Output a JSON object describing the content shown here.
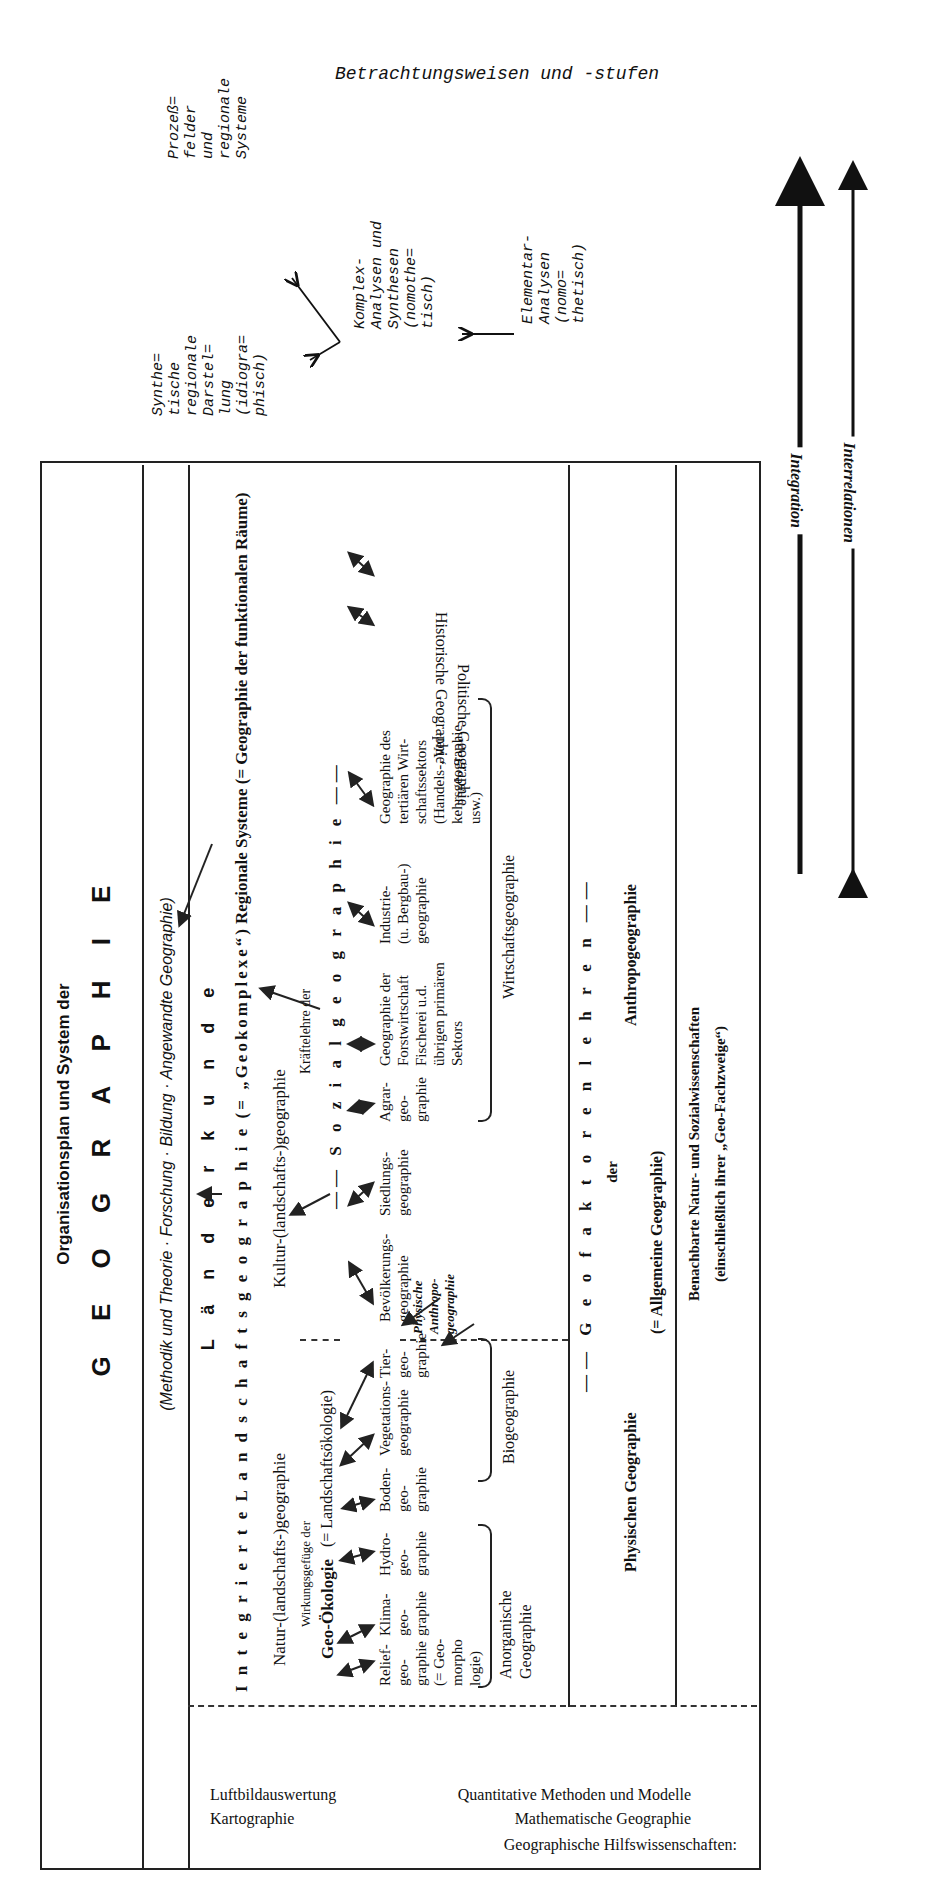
{
  "annotations": {
    "title": "Betrachtungsweisen und -stufen",
    "synthetische": "Synthe=\ntische\nregionale\nDarstel=\nlung\n(idiogra=\nphisch)",
    "prozess": "Prozeß=\nfelder\nund\nregionale\nSysteme",
    "komplex": "Komplex-\nAnalysen und\nSynthesen\n(nomothe=\ntisch)",
    "elementar": "Elementar-\nAnalysen\n(nomo=\nthetisch)",
    "interrelationen": "Interrelationen",
    "integration": "Integration"
  },
  "header": {
    "subtitle": "Organisationsplan und System der",
    "title": "G E O G R A P H I E"
  },
  "methodik_row": "(Methodik und Theorie · Forschung · Bildung · Angewandte Geographie)",
  "laenderkunde": {
    "title": "L ä n d e r k u n d e",
    "integrierte": "I n t e g r i e r t e  L a n d s c h a f t s g e o g r a p h i e (= „Geokomplexe“)",
    "regionale": "Regionale Systeme (= Geographie der funktionalen Räume)"
  },
  "natur": "Natur-(landschafts-)geographie",
  "kultur": "Kultur-(landschafts-)geographie",
  "wirkungsgefuege": "Wirkungsgefüge der",
  "geooekologie": "Geo-Ökologie",
  "landschaftsoekologie": "(= Landschaftsökologie)",
  "kraeftelehre": "Kräftelehre der",
  "sozialgeographie": "—— S o z i a l g e o g r a p h i e ——",
  "physical_items": [
    {
      "label": "Relief-\ngeo-\ngraphie\n(= Geo-\nmorpho\nlogie)"
    },
    {
      "label": "Klima-\ngeo-\ngraphie"
    },
    {
      "label": "Hydro-\ngeo-\ngraphie"
    },
    {
      "label": "Boden-\ngeo-\ngraphie"
    },
    {
      "label": "Vegetations-\ngeographie"
    },
    {
      "label": "Tier-\ngeo-\ngraphie"
    }
  ],
  "human_items": [
    {
      "label": "Bevölkerungs-\ngeographie"
    },
    {
      "label": "Siedlungs-\ngeographie"
    },
    {
      "label": "Agrar-\ngeo-\ngraphie"
    },
    {
      "label": "Geographie der\nForstwirtschaft\nFischerei u.d.\nübrigen primären\nSektors"
    },
    {
      "label": "Industrie-\n(u. Bergbau-)\ngeographie"
    },
    {
      "label": "Geographie des\ntertiären Wirt-\nschaftssektors\n(Handels-, Ver-\nkehrsgeographie\nusw.)"
    }
  ],
  "side_items": [
    {
      "label": "Politische Geographie"
    },
    {
      "label": "Historische Geographie"
    }
  ],
  "physische_anthropo": "Physische\nAnthropo-\ngeographie",
  "groups": {
    "anorganische": "Anorganische\nGeographie",
    "biogeographie": "Biogeographie",
    "wirtschaftsgeographie": "Wirtschaftsgeographie"
  },
  "geofaktoren": {
    "title": "—— G e o f a k t o r e n l e h r e n ——",
    "der": "der",
    "physische": "Physischen Geographie",
    "anthropo": "Anthropogeographie",
    "allgemeine": "(= Allgemeine Geographie)"
  },
  "benachbarte": {
    "line1": "Benachbarte Natur- und Sozialwissenschaften",
    "line2": "(einschließlich ihrer „Geo-Fachzweige“)"
  },
  "hilfswissenschaften": {
    "title": "Geographische Hilfswissenschaften:",
    "line1": "Mathematische Geographie",
    "line2": "Quantitative Methoden und Modelle",
    "line3": "Kartographie",
    "line4": "Luftbildauswertung"
  }
}
